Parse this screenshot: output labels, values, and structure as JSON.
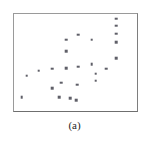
{
  "figure": {
    "caption": "(a)",
    "panel_label": "a",
    "frame_color": "#8c8c8c",
    "background_color": "#ffffff",
    "marker_color": "#5f5f68"
  },
  "chart_data": {
    "type": "scatter",
    "title": "",
    "subtitle": "",
    "xlabel": "",
    "ylabel": "",
    "xlim": [
      0,
      100
    ],
    "ylim": [
      0,
      100
    ],
    "grid": false,
    "legend": null,
    "axis_ticks": {
      "x": [],
      "y": []
    },
    "annotations": [
      {
        "text": "(a)",
        "position": "below-axes-center"
      }
    ],
    "series": [
      {
        "name": "points",
        "marker": "square",
        "marker_size": 2.6,
        "color": "#5f5f68",
        "points": [
          {
            "x": 83.2,
            "y": 95.0
          },
          {
            "x": 83.2,
            "y": 87.9
          },
          {
            "x": 83.2,
            "y": 79.8
          },
          {
            "x": 83.2,
            "y": 70.7
          },
          {
            "x": 83.2,
            "y": 54.5
          },
          {
            "x": 52.0,
            "y": 78.8
          },
          {
            "x": 42.4,
            "y": 73.7
          },
          {
            "x": 42.4,
            "y": 61.6
          },
          {
            "x": 63.2,
            "y": 73.7
          },
          {
            "x": 63.2,
            "y": 48.5
          },
          {
            "x": 66.4,
            "y": 38.4
          },
          {
            "x": 75.2,
            "y": 43.4
          },
          {
            "x": 66.4,
            "y": 31.3
          },
          {
            "x": 52.0,
            "y": 45.5
          },
          {
            "x": 42.4,
            "y": 44.4
          },
          {
            "x": 51.2,
            "y": 27.3
          },
          {
            "x": 38.4,
            "y": 29.3
          },
          {
            "x": 31.2,
            "y": 23.2
          },
          {
            "x": 36.8,
            "y": 14.1
          },
          {
            "x": 45.6,
            "y": 13.1
          },
          {
            "x": 50.4,
            "y": 11.1
          },
          {
            "x": 31.2,
            "y": 43.4
          },
          {
            "x": 20.0,
            "y": 41.4
          },
          {
            "x": 10.4,
            "y": 36.4
          },
          {
            "x": 6.4,
            "y": 14.1
          }
        ]
      }
    ]
  }
}
